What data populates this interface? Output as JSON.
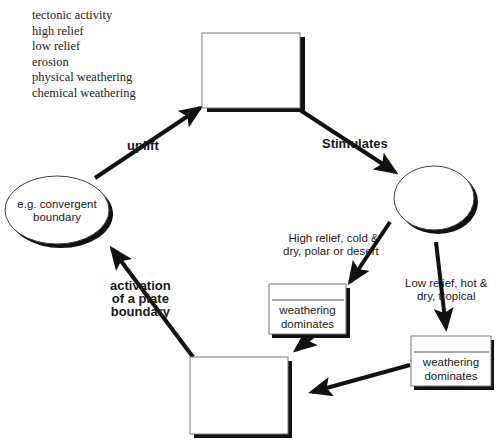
{
  "word_bank": [
    "tectonic activity",
    "high relief",
    "low relief",
    "erosion",
    "physical weathering",
    "chemical weathering"
  ],
  "nodes": {
    "top_box": "",
    "left_ellipse": "e.g. convergent\nboundary",
    "right_ellipse": "",
    "mid_box": {
      "blank": "",
      "text": "weathering\ndominates"
    },
    "right_box": {
      "blank": "",
      "text": "weathering\ndominates"
    },
    "bottom_box": ""
  },
  "arrows": {
    "uplift": "uplift",
    "stimulates": "Stimulates",
    "high_relief": "High relief, cold &\ndry, polar or desert",
    "low_relief": "Low relief, hot &\ndry, tropical",
    "activation": "activation\nof a plate\nboundary"
  },
  "colors": {
    "line": "#111111",
    "box_border": "#555555"
  }
}
